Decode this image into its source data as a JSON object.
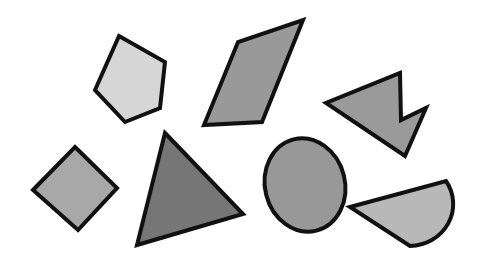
{
  "canvas": {
    "width": 479,
    "height": 262,
    "background_color": "#ffffff",
    "title": "Geometric Shapes Figure"
  },
  "style": {
    "outline_color": "#111111",
    "outline_width": 4
  },
  "shapes": [
    {
      "id": "pentagon",
      "name": "pentagon",
      "label": "Pentagon",
      "kind": "polygon",
      "fill_color": "#d6d6d6",
      "stroke_color": "#111111",
      "stroke_width": 4,
      "points": "119,36 165,62 160,108 125,122 95,90",
      "bbox": [
        95,
        36,
        70,
        86
      ]
    },
    {
      "id": "parallelogram",
      "name": "parallelogram",
      "label": "Parallelogram",
      "kind": "polygon",
      "fill_color": "#999999",
      "stroke_color": "#111111",
      "stroke_width": 4,
      "points": "303,20 262,122 204,125 238,42",
      "bbox": [
        204,
        20,
        99,
        105
      ]
    },
    {
      "id": "arrow",
      "name": "arrow-chevron",
      "label": "Arrow",
      "kind": "polygon",
      "fill_color": "#9a9a9a",
      "stroke_color": "#111111",
      "stroke_width": 4,
      "points": "400,73 401,120 426,108 405,156 326,103",
      "bbox": [
        326,
        73,
        100,
        83
      ]
    },
    {
      "id": "diamond",
      "name": "diamond",
      "label": "Diamond",
      "kind": "polygon",
      "fill_color": "#a8a8a8",
      "stroke_color": "#111111",
      "stroke_width": 4,
      "points": "75,147 117,188 78,230 33,190",
      "bbox": [
        33,
        147,
        84,
        83
      ]
    },
    {
      "id": "triangle",
      "name": "triangle",
      "label": "Triangle",
      "kind": "polygon",
      "fill_color": "#767676",
      "stroke_color": "#111111",
      "stroke_width": 4,
      "points": "165,133 243,214 137,245",
      "bbox": [
        137,
        133,
        106,
        112
      ]
    },
    {
      "id": "ellipse",
      "name": "ellipse",
      "label": "Ellipse",
      "kind": "ellipse",
      "fill_color": "#989898",
      "stroke_color": "#111111",
      "stroke_width": 4,
      "cx": 305,
      "cy": 185,
      "rx": 40,
      "ry": 47,
      "rotation": -14,
      "bbox": [
        263,
        138,
        84,
        94
      ]
    },
    {
      "id": "half-disc",
      "name": "half-disc",
      "label": "Half Disc",
      "kind": "path",
      "fill_color": "#b8b8b8",
      "stroke_color": "#111111",
      "stroke_width": 4,
      "path": "M 350,207 L 446,181 A 44 42 0 0 1 410,246 Z",
      "bbox": [
        350,
        181,
        96,
        65
      ]
    }
  ],
  "summary": {
    "shape_count": 7,
    "shape_names": [
      "Pentagon",
      "Parallelogram",
      "Arrow",
      "Diamond",
      "Triangle",
      "Ellipse",
      "Half Disc"
    ]
  }
}
